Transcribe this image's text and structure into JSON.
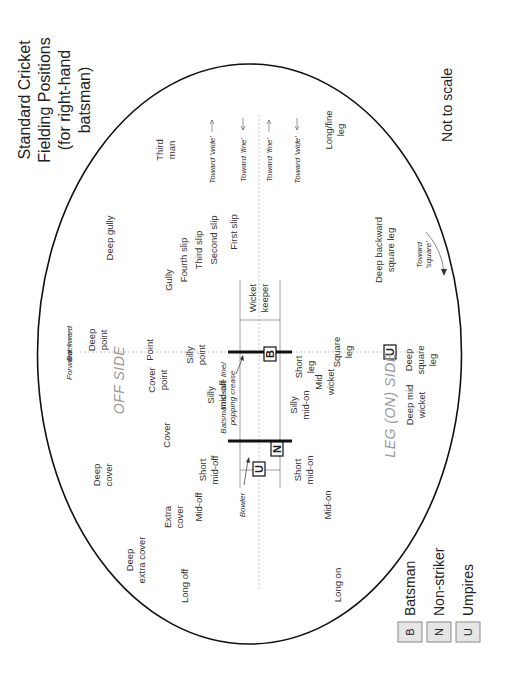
{
  "title": {
    "lines": [
      "Standard Cricket",
      "Fielding Positions",
      "(for right-hand",
      "batsman)"
    ]
  },
  "note": "Not to scale",
  "orientation": "rotated 90 degrees counter-clockwise",
  "sides": {
    "off": "OFF SIDE",
    "leg": "LEG (ON) SIDE"
  },
  "directions": {
    "forward": "Forward",
    "backward": "Backward",
    "toward_wide_off": "Toward 'wide'",
    "toward_fine_off": "Toward 'fine'",
    "toward_fine_leg": "Toward 'fine'",
    "toward_wide_leg": "Toward 'wide'",
    "toward_square": [
      "Toward",
      "'square'"
    ]
  },
  "pitch_labels": {
    "crease": [
      "Batsman's safe line/",
      "popping crease"
    ],
    "bowler": "Bowler"
  },
  "markers": {
    "batsman": "B",
    "non_striker": "N",
    "umpire": "U"
  },
  "positions": {
    "third_man": [
      "Third",
      "man"
    ],
    "deep_gully": [
      "Deep gully"
    ],
    "gully": [
      "Gully"
    ],
    "fourth_slip": [
      "Fourth slip"
    ],
    "third_slip": [
      "Third slip"
    ],
    "second_slip": [
      "Second slip"
    ],
    "first_slip": [
      "First slip"
    ],
    "wicket_keeper": [
      "Wicket",
      "keeper"
    ],
    "long_fine_leg": [
      "Long/fine",
      "leg"
    ],
    "deep_backward_square_leg": [
      "Deep backward",
      "square leg"
    ],
    "deep_point": [
      "Deep",
      "point"
    ],
    "point": [
      "Point"
    ],
    "silly_point": [
      "Silly",
      "point"
    ],
    "short_leg": [
      "Short",
      "leg"
    ],
    "square_leg": [
      "Square",
      "leg"
    ],
    "deep_square_leg": [
      "Deep",
      "square",
      "leg"
    ],
    "cover_point": [
      "Cover",
      "point"
    ],
    "silly_mid_off": [
      "Silly",
      "mid-off"
    ],
    "silly_mid_on": [
      "Silly",
      "mid-on"
    ],
    "mid_wicket": [
      "Mid",
      "wicket"
    ],
    "deep_mid_wicket": [
      "Deep mid",
      "wicket"
    ],
    "cover": [
      "Cover"
    ],
    "deep_cover": [
      "Deep",
      "cover"
    ],
    "short_mid_off": [
      "Short",
      "mid-off"
    ],
    "short_mid_on": [
      "Short",
      "mid-on"
    ],
    "extra_cover": [
      "Extra",
      "cover"
    ],
    "mid_off": [
      "Mid-off"
    ],
    "mid_on": [
      "Mid-on"
    ],
    "deep_extra_cover": [
      "Deep",
      "extra cover"
    ],
    "long_off": [
      "Long off"
    ],
    "long_on": [
      "Long on"
    ]
  },
  "legend": [
    {
      "symbol": "B",
      "label": "Batsman"
    },
    {
      "symbol": "N",
      "label": "Non-striker"
    },
    {
      "symbol": "U",
      "label": "Umpires"
    }
  ],
  "colors": {
    "boundary": "#111111",
    "text": "#333333",
    "side_label": "#9a9a9a",
    "dotted_line": "#bbbbbb",
    "legend_box_fill": "#e6e6e6"
  }
}
